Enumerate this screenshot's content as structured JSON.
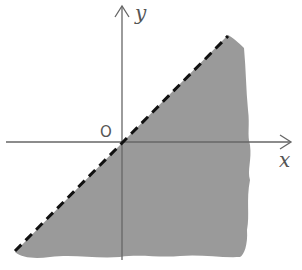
{
  "diagram": {
    "type": "inequality-region",
    "axes": {
      "x_label": "x",
      "y_label": "y",
      "origin_label": "O"
    },
    "boundary": {
      "equation": "y = x",
      "style": "dashed",
      "included": false
    },
    "shaded_region": "y < x",
    "colors": {
      "fill": "#9a9a9a",
      "axis": "#555555",
      "boundary": "#111111",
      "background": "#ffffff"
    }
  }
}
